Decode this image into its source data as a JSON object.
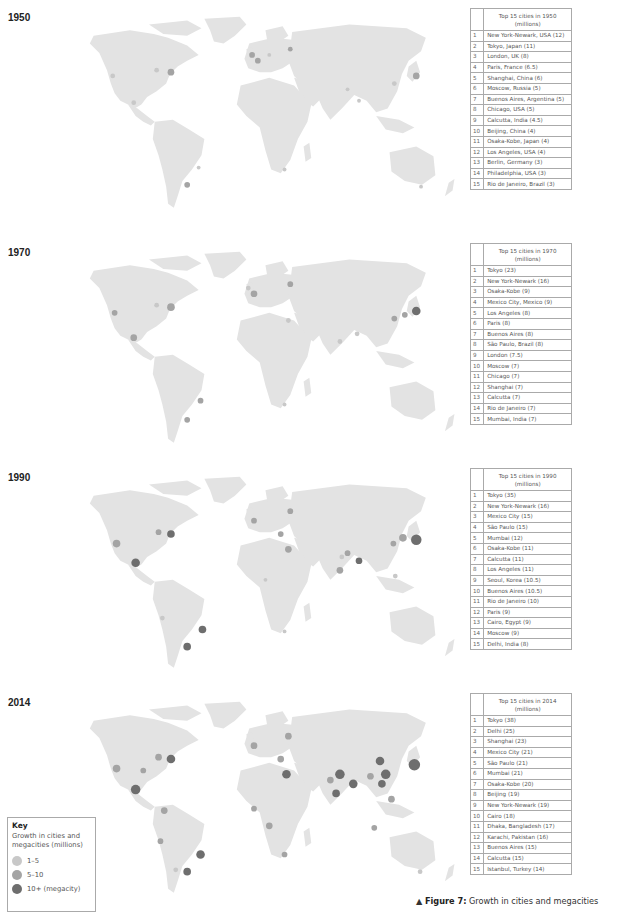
{
  "figure": {
    "caption_marker": "▲",
    "caption_label": "Figure 7:",
    "caption_text": " Growth in cities and megacities"
  },
  "key": {
    "title": "Key",
    "subtitle": "Growth in cities and megacities (millions)",
    "items": [
      {
        "label": "1–5",
        "color": "#c8c8c8"
      },
      {
        "label": "5–10",
        "color": "#a4a4a4"
      },
      {
        "label": "10+ (megacity)",
        "color": "#6e6e6e"
      }
    ]
  },
  "panels": [
    {
      "year": "1950",
      "table_header": "Top 15 cities in 1950",
      "table_unit": "(millions)",
      "rows": [
        {
          "rank": "1",
          "city": "New York-Newark, USA (12)"
        },
        {
          "rank": "2",
          "city": "Tokyo, Japan (11)"
        },
        {
          "rank": "3",
          "city": "London, UK (8)"
        },
        {
          "rank": "4",
          "city": "Paris, France (6.5)"
        },
        {
          "rank": "5",
          "city": "Shanghai, China (6)"
        },
        {
          "rank": "6",
          "city": "Moscow, Russia (5)"
        },
        {
          "rank": "7",
          "city": "Buenos Aires, Argentina (5)"
        },
        {
          "rank": "8",
          "city": "Chicago, USA (5)"
        },
        {
          "rank": "9",
          "city": "Calcutta, India (4.5)"
        },
        {
          "rank": "10",
          "city": "Beijing, China (4)"
        },
        {
          "rank": "11",
          "city": "Osaka-Kobe, Japan (4)"
        },
        {
          "rank": "12",
          "city": "Los Angeles, USA (4)"
        },
        {
          "rank": "13",
          "city": "Berlin, Germany (3)"
        },
        {
          "rank": "14",
          "city": "Philadelphia, USA (3)"
        },
        {
          "rank": "15",
          "city": "Rio de Janeiro, Brazil (3)"
        }
      ]
    },
    {
      "year": "1970",
      "table_header": "Top 15 cities in 1970",
      "table_unit": "(millions)",
      "rows": [
        {
          "rank": "1",
          "city": "Tokyo (23)"
        },
        {
          "rank": "2",
          "city": "New York-Newark (16)"
        },
        {
          "rank": "3",
          "city": "Osaka-Kobe (9)"
        },
        {
          "rank": "4",
          "city": "Mexico City, Mexico (9)"
        },
        {
          "rank": "5",
          "city": "Los Angeles (8)"
        },
        {
          "rank": "6",
          "city": "Paris (8)"
        },
        {
          "rank": "7",
          "city": "Buenos Aires (8)"
        },
        {
          "rank": "8",
          "city": "São Paulo, Brazil (8)"
        },
        {
          "rank": "9",
          "city": "London (7.5)"
        },
        {
          "rank": "10",
          "city": "Moscow (7)"
        },
        {
          "rank": "11",
          "city": "Chicago (7)"
        },
        {
          "rank": "12",
          "city": "Shanghai (7)"
        },
        {
          "rank": "13",
          "city": "Calcutta (7)"
        },
        {
          "rank": "14",
          "city": "Rio de Janeiro (7)"
        },
        {
          "rank": "15",
          "city": "Mumbai, India (7)"
        }
      ]
    },
    {
      "year": "1990",
      "table_header": "Top 15 cities in 1990",
      "table_unit": "(millions)",
      "rows": [
        {
          "rank": "1",
          "city": "Tokyo (35)"
        },
        {
          "rank": "2",
          "city": "New York-Newark (16)"
        },
        {
          "rank": "3",
          "city": "Mexico City (15)"
        },
        {
          "rank": "4",
          "city": "São Paulo (15)"
        },
        {
          "rank": "5",
          "city": "Mumbai (12)"
        },
        {
          "rank": "6",
          "city": "Osaka-Kobe (11)"
        },
        {
          "rank": "7",
          "city": "Calcutta (11)"
        },
        {
          "rank": "8",
          "city": "Los Angeles (11)"
        },
        {
          "rank": "9",
          "city": "Seoul, Korea (10.5)"
        },
        {
          "rank": "10",
          "city": "Buenos Aires (10.5)"
        },
        {
          "rank": "11",
          "city": "Rio de Janeiro (10)"
        },
        {
          "rank": "12",
          "city": "Paris (9)"
        },
        {
          "rank": "13",
          "city": "Cairo, Egypt (9)"
        },
        {
          "rank": "14",
          "city": "Moscow (9)"
        },
        {
          "rank": "15",
          "city": "Delhi, India (8)"
        }
      ]
    },
    {
      "year": "2014",
      "table_header": "Top 15 cities in 2014",
      "table_unit": "(millions)",
      "rows": [
        {
          "rank": "1",
          "city": "Tokyo (38)"
        },
        {
          "rank": "2",
          "city": "Delhi (25)"
        },
        {
          "rank": "3",
          "city": "Shanghai (23)"
        },
        {
          "rank": "4",
          "city": "Mexico City (21)"
        },
        {
          "rank": "5",
          "city": "São Paulo (21)"
        },
        {
          "rank": "6",
          "city": "Mumbai (21)"
        },
        {
          "rank": "7",
          "city": "Osaka-Kobe (20)"
        },
        {
          "rank": "8",
          "city": "Beijing (19)"
        },
        {
          "rank": "9",
          "city": "New York-Newark (19)"
        },
        {
          "rank": "10",
          "city": "Cairo (18)"
        },
        {
          "rank": "11",
          "city": "Dhaka, Bangladesh (17)"
        },
        {
          "rank": "12",
          "city": "Karachi, Pakistan (16)"
        },
        {
          "rank": "13",
          "city": "Buenos Aires (15)"
        },
        {
          "rank": "14",
          "city": "Calcutta (15)"
        },
        {
          "rank": "15",
          "city": "Istanbul, Turkey (14)"
        }
      ]
    }
  ],
  "colors": {
    "land": "#e3e3e3",
    "dot_small": "#c8c8c8",
    "dot_medium": "#a4a4a4",
    "dot_large": "#6e6e6e",
    "table_border": "#aaaaaa"
  }
}
